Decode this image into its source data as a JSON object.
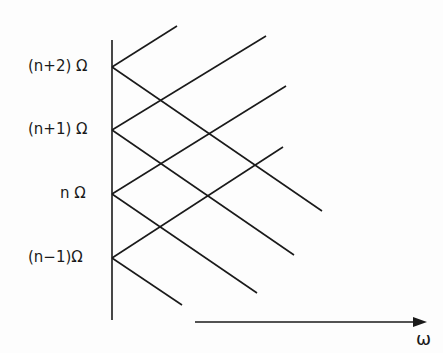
{
  "diagram": {
    "levels": [
      {
        "label": "(n+2) Ω",
        "y": 67
      },
      {
        "label": "(n+1) Ω",
        "y": 130
      },
      {
        "label": "n Ω",
        "y": 194
      },
      {
        "label": "(n−1)Ω",
        "y": 258
      }
    ],
    "axis_label": "ω",
    "line_color": "#1a1a1a"
  }
}
